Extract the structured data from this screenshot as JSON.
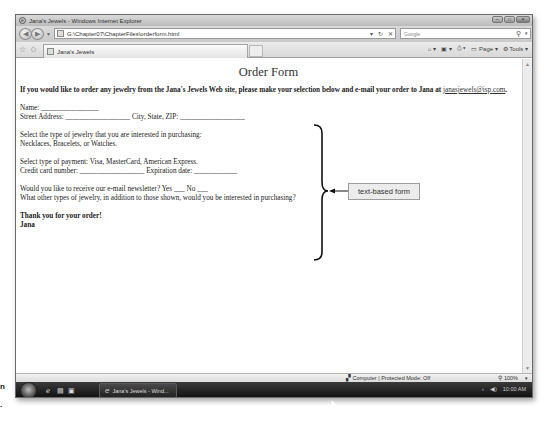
{
  "window": {
    "title": "Jana's Jewels - Windows Internet Explorer",
    "controls": [
      "minimize",
      "maximize",
      "close"
    ]
  },
  "address_bar": {
    "url": "G:\\Chapter07\\ChapterFiles\\orderform.html",
    "refresh_icon": "refresh-icon",
    "stop_icon": "stop-icon"
  },
  "search": {
    "placeholder": "Google"
  },
  "tabs": [
    {
      "label": "Jana's Jewels"
    }
  ],
  "command_bar": {
    "home": "home-icon",
    "feeds": "feeds-icon",
    "print": "print-icon",
    "page_label": "Page",
    "tools_label": "Tools"
  },
  "page": {
    "title": "Order Form",
    "intro": "If you would like to order any jewelry from the Jana's Jewels Web site, please make your selection below and e-mail your order to Jana at",
    "email": "janasjewels@isp.com",
    "email_suffix": ".",
    "lines": {
      "name": "Name: ________________",
      "address": "Street Address: __________________ City, State, ZIP: __________________",
      "select_type": "Select the type of jewelry that you are interested in purchasing:",
      "types": "Necklaces, Bracelets, or Watches.",
      "payment": "Select type of payment: Visa, MasterCard, American Express.",
      "credit": "Credit card number: __________________ Expiration date: ____________",
      "newsletter": "Would you like to receive our e-mail newsletter? Yes ___ No ___",
      "other": "What other types of jewelry, in addition to those shown, would you be interested in purchasing?",
      "thanks": "Thank you for your order!",
      "signature": "Jana"
    }
  },
  "callout": {
    "label": "text-based form"
  },
  "status_bar": {
    "zone": "Computer | Protected Mode: Off",
    "zoom": "100%"
  },
  "taskbar": {
    "button_label": "Jana's Jewels - Wind...",
    "clock": "10:00 AM"
  },
  "edge_text": {
    "top": "n",
    "bottom": "."
  }
}
